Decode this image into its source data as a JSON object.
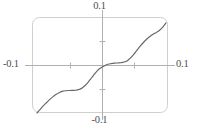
{
  "figure": {
    "name": "devils-staircase-plot",
    "frame_color": "#cfcfcf",
    "axis_color": "#b3b3b3",
    "curve_color": "#666666",
    "background": "#ffffff"
  },
  "labels": {
    "top": "0.1",
    "bottom": "-0.1",
    "left": "-0.1",
    "right": "0.1"
  },
  "chart_data": {
    "type": "line",
    "title": "",
    "xlabel": "",
    "ylabel": "",
    "xlim": [
      -0.1,
      0.1
    ],
    "ylim": [
      -0.1,
      0.1
    ],
    "grid": false,
    "legend": "none",
    "axes_style": "centered-cross-with-rounded-frame",
    "xticks": [
      -0.05,
      0.05
    ],
    "yticks": [
      -0.05,
      0.05
    ],
    "xtick_labels": [
      "-0.1",
      "0.1"
    ],
    "ytick_labels": [
      "-0.1",
      "0.1"
    ],
    "series": [
      {
        "name": "staircase",
        "x": [
          -0.1,
          -0.095,
          -0.09,
          -0.085,
          -0.08,
          -0.075,
          -0.07,
          -0.065,
          -0.06,
          -0.055,
          -0.05,
          -0.045,
          -0.04,
          -0.035,
          -0.03,
          -0.025,
          -0.02,
          -0.015,
          -0.01,
          -0.005,
          0.0,
          0.005,
          0.01,
          0.015,
          0.02,
          0.025,
          0.03,
          0.035,
          0.04,
          0.045,
          0.05,
          0.055,
          0.06,
          0.065,
          0.07,
          0.075,
          0.08,
          0.085,
          0.09,
          0.095,
          0.1
        ],
        "y": [
          -0.1,
          -0.092,
          -0.084,
          -0.077,
          -0.07,
          -0.064,
          -0.059,
          -0.055,
          -0.052,
          -0.051,
          -0.0505,
          -0.0502,
          -0.05,
          -0.0485,
          -0.045,
          -0.039,
          -0.031,
          -0.022,
          -0.013,
          -0.005,
          0.0,
          0.004,
          0.007,
          0.0085,
          0.0095,
          0.01,
          0.0105,
          0.012,
          0.015,
          0.021,
          0.029,
          0.038,
          0.047,
          0.055,
          0.062,
          0.068,
          0.073,
          0.077,
          0.082,
          0.089,
          0.098
        ]
      }
    ]
  }
}
